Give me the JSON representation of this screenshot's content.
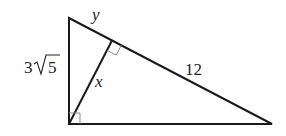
{
  "diagram": {
    "type": "right-triangle-with-altitude",
    "colors": {
      "stroke": "#1a1a1a",
      "right_angle_mark": "#8a8a8a",
      "label": "#222222",
      "background": "#ffffff"
    },
    "labels": {
      "short_hyp_segment": "y",
      "vertical_leg": "3",
      "vertical_leg_radicand": "5",
      "vertical_leg_full": "3√5",
      "altitude": "x",
      "long_hyp_segment": "12"
    },
    "right_angles": [
      "bottom-left vertex",
      "foot of altitude on hypotenuse"
    ]
  }
}
